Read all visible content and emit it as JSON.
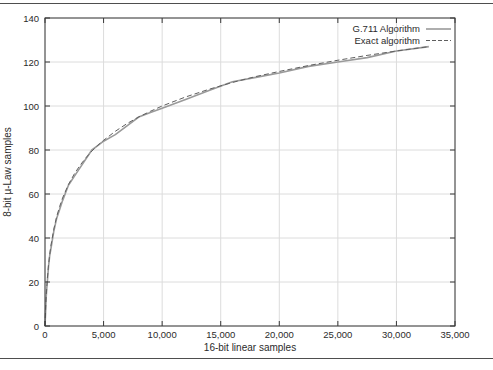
{
  "figure": {
    "background": "#ffffff",
    "rule_color": "#4e4e4e"
  },
  "chart_data": {
    "type": "line",
    "title": "",
    "xlabel": "16-bit linear samples",
    "ylabel": "8-bit µ-Law samples",
    "xlim": [
      0,
      35000
    ],
    "ylim": [
      0,
      140
    ],
    "x_ticks": [
      0,
      5000,
      10000,
      15000,
      20000,
      25000,
      30000,
      35000
    ],
    "x_tick_labels": [
      "0",
      "5,000",
      "10,000",
      "15,000",
      "20,000",
      "25,000",
      "30,000",
      "35,000"
    ],
    "y_ticks": [
      0,
      20,
      40,
      60,
      80,
      100,
      120,
      140
    ],
    "y_tick_labels": [
      "0",
      "20",
      "40",
      "60",
      "80",
      "100",
      "120",
      "140"
    ],
    "grid": true,
    "grid_color": "#dcdcdc",
    "border_color": "#3a3a3a",
    "legend_position": "top-right",
    "x": [
      0,
      10,
      25,
      50,
      100,
      150,
      200,
      300,
      400,
      500,
      750,
      1000,
      1250,
      1500,
      2000,
      2500,
      3000,
      3500,
      4000,
      4500,
      5000,
      6000,
      7000,
      8000,
      9000,
      10000,
      12000,
      14000,
      16000,
      18000,
      20000,
      22500,
      25000,
      27500,
      30000,
      32767
    ],
    "series": [
      {
        "name": "G.711 Algorithm",
        "style": "solid",
        "color": "#9a9a9a",
        "width": 1.6,
        "values": [
          0,
          1,
          3,
          6,
          13,
          17,
          20,
          27,
          32,
          35,
          43,
          49,
          53,
          57,
          64,
          68,
          72,
          76,
          80,
          82,
          84,
          87,
          91,
          95,
          97,
          99,
          103,
          107,
          111,
          113,
          115,
          118,
          120,
          122,
          125,
          127
        ]
      },
      {
        "name": "Exact algorithm",
        "style": "dashed",
        "color": "#5f5f5f",
        "width": 1,
        "values": [
          0,
          1.7,
          4.1,
          7.5,
          13.2,
          17.7,
          21.5,
          27.6,
          32.4,
          36.4,
          44.0,
          49.8,
          54.3,
          58.2,
          64.3,
          69.1,
          73.1,
          76.5,
          79.5,
          82.1,
          84.4,
          88.5,
          92.0,
          95.0,
          97.6,
          100.0,
          104.1,
          107.6,
          110.7,
          113.4,
          115.7,
          118.4,
          120.8,
          123.0,
          125.0,
          127.0
        ]
      }
    ]
  }
}
